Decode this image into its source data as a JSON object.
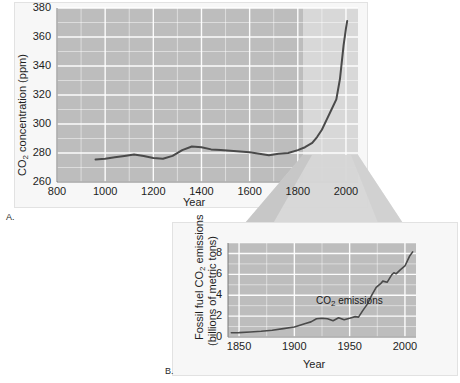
{
  "figure": {
    "panels": [
      {
        "letter": "A.",
        "xlabel": "Year",
        "ylabel_main": "CO",
        "ylabel_sub": "2",
        "ylabel_rest": " concentration (ppm)"
      },
      {
        "letter": "B.",
        "xlabel": "Year",
        "ylabel_line1_a": "Fossil fuel CO",
        "ylabel_line1_sub": "2",
        "ylabel_line1_b": " emissions",
        "ylabel_line2": "(billions of metric tons)",
        "annotation_a": "CO",
        "annotation_sub": "2",
        "annotation_b": " emissions"
      }
    ],
    "colors": {
      "plot_background": "#bdbdbd",
      "highlight_background": "#d8d8d8",
      "gridline": "#ffffff",
      "curve": "#4a4a4a",
      "card_background": "#f7f7f7",
      "page_background": "#ffffff"
    }
  },
  "chart_data": [
    {
      "type": "line",
      "title": "",
      "panel": "A",
      "xlabel": "Year",
      "ylabel": "CO2 concentration (ppm)",
      "xlim": [
        800,
        2050
      ],
      "ylim": [
        260,
        380
      ],
      "xticks": [
        800,
        1000,
        1200,
        1400,
        1600,
        1800,
        2000
      ],
      "xticklabels": [
        "800",
        "1000",
        "1200",
        "1400",
        "1600",
        "1800",
        "2000"
      ],
      "yticks": [
        260,
        280,
        300,
        320,
        340,
        360,
        380
      ],
      "yticklabels": [
        "260",
        "280",
        "300",
        "320",
        "340",
        "360",
        "380"
      ],
      "x_minor_step": 100,
      "y_minor_step": 10,
      "grid": true,
      "legend": "none",
      "highlight_span": [
        1795,
        2050
      ],
      "series": [
        {
          "name": "CO2 concentration",
          "x": [
            960,
            1000,
            1040,
            1080,
            1120,
            1160,
            1200,
            1240,
            1280,
            1320,
            1360,
            1400,
            1440,
            1480,
            1520,
            1560,
            1600,
            1640,
            1680,
            1720,
            1760,
            1800,
            1830,
            1860,
            1880,
            1900,
            1920,
            1940,
            1960,
            1975,
            1990,
            2000,
            2005
          ],
          "values": [
            275.5,
            276.0,
            277.0,
            278.0,
            279.0,
            278.0,
            276.5,
            276.0,
            278.0,
            282.0,
            284.5,
            284.0,
            282.5,
            282.0,
            281.5,
            281.0,
            280.5,
            279.5,
            278.5,
            279.5,
            280.0,
            282.0,
            284.0,
            287.0,
            291.0,
            296.0,
            303.0,
            310.0,
            317.0,
            331.0,
            354.0,
            366.0,
            371.0
          ]
        }
      ]
    },
    {
      "type": "line",
      "title": "",
      "panel": "B",
      "xlabel": "Year",
      "ylabel": "Fossil fuel CO2 emissions (billions of metric tons)",
      "xlim": [
        1840,
        2010
      ],
      "ylim": [
        0,
        9
      ],
      "xticks": [
        1850,
        1900,
        1950,
        2000
      ],
      "xticklabels": [
        "1850",
        "1900",
        "1950",
        "2000"
      ],
      "yticks": [
        0,
        2,
        4,
        6,
        8
      ],
      "yticklabels": [
        "0",
        "2",
        "4",
        "6",
        "8"
      ],
      "x_minor_step": 25,
      "y_minor_step": 1,
      "grid": true,
      "legend": "none",
      "annotation": "CO2 emissions",
      "series": [
        {
          "name": "Fossil fuel CO2 emissions",
          "x": [
            1843,
            1850,
            1860,
            1870,
            1880,
            1890,
            1900,
            1910,
            1915,
            1920,
            1925,
            1930,
            1935,
            1940,
            1945,
            1950,
            1955,
            1958,
            1962,
            1966,
            1970,
            1974,
            1978,
            1980,
            1984,
            1988,
            1990,
            1992,
            1996,
            2000,
            2004,
            2007
          ],
          "values": [
            0.4,
            0.42,
            0.48,
            0.55,
            0.65,
            0.8,
            0.95,
            1.3,
            1.45,
            1.75,
            1.8,
            1.75,
            1.55,
            1.85,
            1.65,
            1.8,
            1.95,
            1.9,
            2.55,
            3.15,
            4.0,
            4.75,
            5.1,
            5.35,
            5.25,
            5.95,
            6.15,
            6.05,
            6.45,
            6.8,
            7.7,
            8.15
          ]
        }
      ]
    }
  ]
}
